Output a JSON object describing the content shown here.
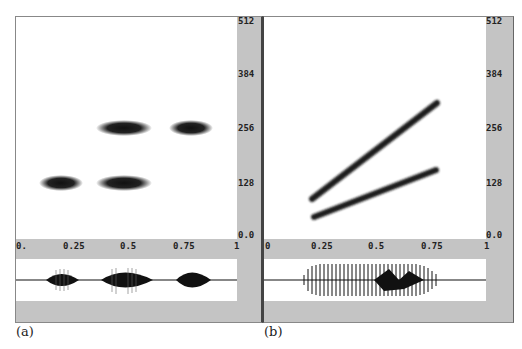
{
  "panels": [
    {
      "caption": "(a)",
      "y_ticks": [
        "512",
        "384",
        "256",
        "128",
        "0.0"
      ],
      "x_ticks": [
        "0.",
        "0.25",
        "0.5",
        "0.75",
        "1"
      ],
      "description": "Spectrogram with five horizontal blobs: two at ~128 (x≈0.2, 0.5), three... at ~256 (x≈0.5, 0.8); waveform below with three bursts"
    },
    {
      "caption": "(b)",
      "y_ticks": [
        "512",
        "384",
        "256",
        "128",
        "0.0"
      ],
      "x_ticks": [
        "0",
        "0.25",
        "0.5",
        "0.75",
        "1"
      ],
      "description": "Spectrogram with two rising chirp lines; waveform below with long dense burst"
    }
  ],
  "colors": {
    "panel_bg": "#c4c4c4",
    "plot_bg": "#ffffff",
    "ink": "#1a1a1a"
  }
}
